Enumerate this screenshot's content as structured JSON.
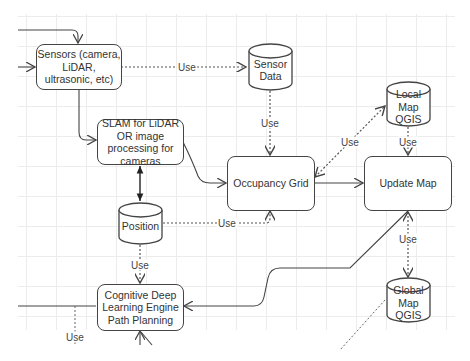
{
  "diagram": {
    "nodes": {
      "sensors": {
        "label": "Sensors (camera, LiDAR, ultrasonic, etc)",
        "shape": "rounded-rect"
      },
      "sensor_data": {
        "label": "Sensor Data",
        "shape": "cylinder"
      },
      "slam": {
        "label": "SLAM for LiDAR OR image processing for cameras",
        "shape": "rounded-rect"
      },
      "local_map": {
        "label": "Local Map QGIS",
        "shape": "cylinder"
      },
      "occupancy_grid": {
        "label": "Occupancy Grid",
        "shape": "rounded-rect"
      },
      "update_map": {
        "label": "Update Map",
        "shape": "rounded-rect"
      },
      "position": {
        "label": "Position",
        "shape": "cylinder"
      },
      "cognitive": {
        "label": "Cognitive Deep Learning Engine Path Planning",
        "shape": "rounded-rect"
      },
      "global_map": {
        "label": "Global Map QGIS",
        "shape": "cylinder"
      }
    },
    "edge_labels": {
      "sensors_to_sensor_data": "Use",
      "sensor_data_to_occupancy": "Use",
      "occupancy_to_local_map": "Use",
      "local_map_to_update": "Use",
      "position_to_occupancy": "Use",
      "position_to_cognitive": "Use",
      "update_to_global_map": "Use",
      "cognitive_left_down": "Use"
    },
    "edges": [
      {
        "from": "external",
        "to": "sensors",
        "style": "solid"
      },
      {
        "from": "sensors",
        "to": "sensor_data",
        "style": "dotted",
        "label": "Use"
      },
      {
        "from": "sensors",
        "to": "slam",
        "style": "solid"
      },
      {
        "from": "sensor_data",
        "to": "occupancy_grid",
        "style": "dotted",
        "label": "Use"
      },
      {
        "from": "slam",
        "to": "occupancy_grid",
        "style": "solid"
      },
      {
        "from": "slam",
        "to": "position",
        "style": "solid",
        "bidirectional": true
      },
      {
        "from": "occupancy_grid",
        "to": "local_map",
        "style": "dotted",
        "label": "Use",
        "bidirectional": true
      },
      {
        "from": "local_map",
        "to": "update_map",
        "style": "dotted",
        "label": "Use"
      },
      {
        "from": "occupancy_grid",
        "to": "update_map",
        "style": "solid"
      },
      {
        "from": "position",
        "to": "occupancy_grid",
        "style": "dotted",
        "label": "Use"
      },
      {
        "from": "position",
        "to": "cognitive",
        "style": "dotted",
        "label": "Use"
      },
      {
        "from": "update_map",
        "to": "cognitive",
        "style": "solid"
      },
      {
        "from": "update_map",
        "to": "global_map",
        "style": "dotted",
        "label": "Use",
        "bidirectional": true
      },
      {
        "from": "cognitive",
        "to": "external",
        "style": "solid"
      }
    ],
    "colors": {
      "stroke": "#444444",
      "grid": "#ececec",
      "text": "#333333",
      "background": "#ffffff"
    }
  }
}
